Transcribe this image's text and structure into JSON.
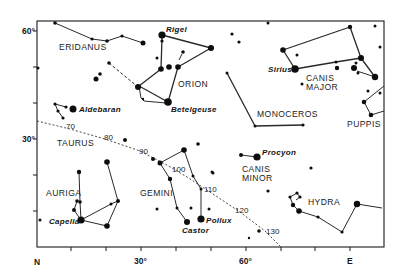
{
  "figure": {
    "kind": "star chart",
    "frame": {
      "left": 37,
      "top": 21,
      "right": 384,
      "bottom": 247
    }
  },
  "axes": {
    "left_labels": {
      "lat60": "60°",
      "lat30": "30°"
    },
    "left_ticks_y": [
      31,
      67,
      103,
      139,
      175,
      211
    ],
    "bottom_labels": {
      "north": "N",
      "az30": "30°",
      "az60": "60°",
      "east": "E"
    },
    "bottom_ticks_x": [
      71,
      106,
      141,
      176,
      211,
      246,
      281,
      315,
      350
    ]
  },
  "constellation_labels": {
    "eridanus": "ERIDANUS",
    "orion": "ORION",
    "monoceros": "MONOCEROS",
    "canis_major_1": "CANIS",
    "canis_major_2": "MAJOR",
    "puppis": "PUPPIS",
    "taurus": "TAURUS",
    "auriga": "AURIGA",
    "gemini": "GEMINI",
    "canis_minor_1": "CANIS",
    "canis_minor_2": "MINOR",
    "hydra": "HYDRA"
  },
  "star_labels": {
    "rigel": "Rigel",
    "betelgeuse": "Betelgeuse",
    "sirius": "Sirius",
    "aldebaran": "Aldebaran",
    "capella": "Capella",
    "castor": "Castor",
    "pollux": "Pollux",
    "procyon": "Procyon"
  },
  "ecliptic": {
    "marks": [
      "70",
      "80",
      "90",
      "100",
      "110",
      "120",
      "130"
    ],
    "points": [
      [
        37,
        121
      ],
      [
        70,
        129
      ],
      [
        105,
        139
      ],
      [
        140,
        151
      ],
      [
        165,
        164
      ],
      [
        187,
        177
      ],
      [
        210,
        192
      ],
      [
        240,
        212
      ],
      [
        265,
        231
      ],
      [
        281,
        247
      ]
    ]
  },
  "lines": [
    {
      "group": "eridanus",
      "style": "solid",
      "points": [
        [
          55,
          23
        ],
        [
          92,
          39
        ],
        [
          107,
          41
        ],
        [
          122,
          36
        ],
        [
          143,
          43
        ]
      ]
    },
    {
      "group": "orion-west",
      "style": "dashed",
      "points": [
        [
          109,
          63
        ],
        [
          138,
          87
        ]
      ]
    },
    {
      "group": "orion",
      "style": "thick",
      "points": [
        [
          162,
          35
        ],
        [
          211,
          48
        ],
        [
          178,
          67
        ],
        [
          168,
          102
        ]
      ]
    },
    {
      "group": "orion",
      "style": "thick",
      "points": [
        [
          162,
          38
        ],
        [
          161,
          69
        ],
        [
          139,
          86
        ],
        [
          168,
          102
        ]
      ]
    },
    {
      "group": "orion",
      "style": "solid",
      "points": [
        [
          139,
          86
        ],
        [
          141,
          98
        ],
        [
          144,
          101
        ],
        [
          166,
          103
        ]
      ]
    },
    {
      "group": "orion",
      "style": "solid",
      "points": [
        [
          182,
          54
        ],
        [
          179,
          60
        ]
      ]
    },
    {
      "group": "monoceros",
      "style": "thick",
      "points": [
        [
          227,
          73
        ],
        [
          255,
          126
        ],
        [
          303,
          125
        ]
      ]
    },
    {
      "group": "canis-major",
      "style": "thick",
      "points": [
        [
          350,
          27
        ],
        [
          283,
          50
        ],
        [
          295,
          69
        ],
        [
          336,
          62
        ],
        [
          361,
          58
        ]
      ]
    },
    {
      "group": "canis-major",
      "style": "thick",
      "points": [
        [
          350,
          27
        ],
        [
          361,
          58
        ],
        [
          375,
          77
        ]
      ]
    },
    {
      "group": "canis-major",
      "style": "solid",
      "points": [
        [
          357,
          71
        ],
        [
          375,
          77
        ]
      ]
    },
    {
      "group": "puppis",
      "style": "solid",
      "points": [
        [
          384,
          86
        ],
        [
          364,
          102
        ],
        [
          371,
          115
        ],
        [
          384,
          111
        ]
      ]
    },
    {
      "group": "taurus",
      "style": "solid",
      "points": [
        [
          66,
          107
        ],
        [
          55,
          104
        ],
        [
          58,
          111
        ],
        [
          63,
          118
        ]
      ]
    },
    {
      "group": "auriga",
      "style": "solid",
      "points": [
        [
          79,
          172
        ],
        [
          80,
          202
        ],
        [
          81,
          220
        ],
        [
          111,
          204
        ],
        [
          118,
          201
        ],
        [
          107,
          162
        ]
      ]
    },
    {
      "group": "auriga",
      "style": "solid",
      "points": [
        [
          81,
          220
        ],
        [
          107,
          226
        ],
        [
          118,
          201
        ]
      ]
    },
    {
      "group": "auriga",
      "style": "solid",
      "points": [
        [
          77,
          201
        ],
        [
          74,
          210
        ],
        [
          81,
          220
        ]
      ]
    },
    {
      "group": "gemini",
      "style": "solid",
      "points": [
        [
          160,
          163
        ],
        [
          184,
          150
        ],
        [
          193,
          176
        ],
        [
          201,
          189
        ],
        [
          201,
          217
        ]
      ]
    },
    {
      "group": "gemini",
      "style": "solid",
      "points": [
        [
          160,
          163
        ],
        [
          170,
          179
        ],
        [
          177,
          208
        ],
        [
          187,
          222
        ]
      ]
    },
    {
      "group": "canis-minor",
      "style": "solid",
      "points": [
        [
          241,
          155
        ],
        [
          257,
          157
        ]
      ]
    },
    {
      "group": "hydra",
      "style": "solid",
      "points": [
        [
          299,
          211
        ],
        [
          293,
          205
        ],
        [
          290,
          197
        ],
        [
          297,
          193
        ],
        [
          300,
          197
        ],
        [
          296,
          200
        ]
      ]
    },
    {
      "group": "hydra",
      "style": "solid",
      "points": [
        [
          299,
          211
        ],
        [
          318,
          217
        ],
        [
          342,
          232
        ],
        [
          357,
          204
        ],
        [
          382,
          208
        ]
      ]
    }
  ],
  "stars": [
    {
      "x": 55,
      "y": 23,
      "r": 1.8
    },
    {
      "x": 92,
      "y": 39,
      "r": 1.6
    },
    {
      "x": 107,
      "y": 41,
      "r": 1.8
    },
    {
      "x": 122,
      "y": 36,
      "r": 1.6
    },
    {
      "x": 143,
      "y": 43,
      "r": 2.5
    },
    {
      "x": 38,
      "y": 68,
      "r": 1.5
    },
    {
      "x": 96,
      "y": 79,
      "r": 2.5
    },
    {
      "x": 100,
      "y": 74,
      "r": 1.8
    },
    {
      "x": 109,
      "y": 63,
      "r": 1.8
    },
    {
      "x": 138,
      "y": 87,
      "r": 3
    },
    {
      "x": 162,
      "y": 35,
      "r": 3.6,
      "name": "Rigel"
    },
    {
      "x": 162,
      "y": 41,
      "r": 1.6
    },
    {
      "x": 157,
      "y": 58,
      "r": 1.5
    },
    {
      "x": 161,
      "y": 69,
      "r": 2.8
    },
    {
      "x": 169,
      "y": 67,
      "r": 2.8
    },
    {
      "x": 178,
      "y": 67,
      "r": 2.8
    },
    {
      "x": 183,
      "y": 52,
      "r": 1.8
    },
    {
      "x": 211,
      "y": 48,
      "r": 3
    },
    {
      "x": 168,
      "y": 102,
      "r": 3.8,
      "name": "Betelgeuse"
    },
    {
      "x": 143,
      "y": 99,
      "r": 1.2
    },
    {
      "x": 268,
      "y": 23,
      "r": 1.5
    },
    {
      "x": 232,
      "y": 34,
      "r": 1.6
    },
    {
      "x": 239,
      "y": 42,
      "r": 1.6
    },
    {
      "x": 227,
      "y": 73,
      "r": 1.5
    },
    {
      "x": 255,
      "y": 126,
      "r": 1.5
    },
    {
      "x": 303,
      "y": 125,
      "r": 1.6
    },
    {
      "x": 283,
      "y": 50,
      "r": 2.8
    },
    {
      "x": 295,
      "y": 69,
      "r": 3.8,
      "name": "Sirius"
    },
    {
      "x": 297,
      "y": 55,
      "r": 1.5
    },
    {
      "x": 336,
      "y": 62,
      "r": 1.5
    },
    {
      "x": 337,
      "y": 68,
      "r": 2.2
    },
    {
      "x": 361,
      "y": 58,
      "r": 3
    },
    {
      "x": 350,
      "y": 27,
      "r": 2.2
    },
    {
      "x": 354,
      "y": 68,
      "r": 3
    },
    {
      "x": 356,
      "y": 63,
      "r": 1.5
    },
    {
      "x": 358,
      "y": 73,
      "r": 1.5
    },
    {
      "x": 375,
      "y": 77,
      "r": 3.2
    },
    {
      "x": 375,
      "y": 26,
      "r": 1.5
    },
    {
      "x": 380,
      "y": 47,
      "r": 1.5
    },
    {
      "x": 302,
      "y": 84,
      "r": 1.5
    },
    {
      "x": 368,
      "y": 91,
      "r": 1.5
    },
    {
      "x": 380,
      "y": 93,
      "r": 1.5
    },
    {
      "x": 364,
      "y": 102,
      "r": 2.3
    },
    {
      "x": 371,
      "y": 115,
      "r": 2.3
    },
    {
      "x": 55,
      "y": 104,
      "r": 1.6
    },
    {
      "x": 66,
      "y": 107,
      "r": 1.6
    },
    {
      "x": 58,
      "y": 111,
      "r": 1.6
    },
    {
      "x": 63,
      "y": 118,
      "r": 1.6
    },
    {
      "x": 73,
      "y": 109,
      "r": 3.5,
      "name": "Aldebaran"
    },
    {
      "x": 125,
      "y": 140,
      "r": 2
    },
    {
      "x": 79,
      "y": 172,
      "r": 2.2
    },
    {
      "x": 77,
      "y": 201,
      "r": 1.8
    },
    {
      "x": 80,
      "y": 202,
      "r": 1.8
    },
    {
      "x": 74,
      "y": 210,
      "r": 2
    },
    {
      "x": 81,
      "y": 220,
      "r": 3.6,
      "name": "Capella"
    },
    {
      "x": 107,
      "y": 162,
      "r": 2.8
    },
    {
      "x": 118,
      "y": 201,
      "r": 2
    },
    {
      "x": 111,
      "y": 204,
      "r": 1.5
    },
    {
      "x": 107,
      "y": 226,
      "r": 2.8
    },
    {
      "x": 40,
      "y": 220,
      "r": 1.5
    },
    {
      "x": 153,
      "y": 159,
      "r": 2
    },
    {
      "x": 160,
      "y": 163,
      "r": 2.5
    },
    {
      "x": 184,
      "y": 150,
      "r": 2.8
    },
    {
      "x": 193,
      "y": 176,
      "r": 1.5
    },
    {
      "x": 201,
      "y": 189,
      "r": 1.5
    },
    {
      "x": 201,
      "y": 219,
      "r": 3.6,
      "name": "Pollux"
    },
    {
      "x": 170,
      "y": 179,
      "r": 2.2
    },
    {
      "x": 177,
      "y": 208,
      "r": 1.5
    },
    {
      "x": 187,
      "y": 222,
      "r": 3,
      "name": "Castor"
    },
    {
      "x": 157,
      "y": 209,
      "r": 1.5
    },
    {
      "x": 191,
      "y": 208,
      "r": 1.5
    },
    {
      "x": 209,
      "y": 209,
      "r": 1.5
    },
    {
      "x": 213,
      "y": 173,
      "r": 1.5
    },
    {
      "x": 198,
      "y": 144,
      "r": 1.8
    },
    {
      "x": 241,
      "y": 155,
      "r": 2
    },
    {
      "x": 257,
      "y": 157,
      "r": 3.6,
      "name": "Procyon"
    },
    {
      "x": 212,
      "y": 172,
      "r": 1.5
    },
    {
      "x": 268,
      "y": 191,
      "r": 1.6
    },
    {
      "x": 311,
      "y": 168,
      "r": 1.6
    },
    {
      "x": 259,
      "y": 231,
      "r": 1.8
    },
    {
      "x": 249,
      "y": 238,
      "r": 1.2
    },
    {
      "x": 290,
      "y": 197,
      "r": 1.6
    },
    {
      "x": 297,
      "y": 193,
      "r": 1.6
    },
    {
      "x": 300,
      "y": 197,
      "r": 1.6
    },
    {
      "x": 293,
      "y": 205,
      "r": 2.2
    },
    {
      "x": 299,
      "y": 211,
      "r": 2.8
    },
    {
      "x": 318,
      "y": 217,
      "r": 1.6
    },
    {
      "x": 342,
      "y": 232,
      "r": 1.6
    },
    {
      "x": 357,
      "y": 204,
      "r": 3.2
    }
  ]
}
